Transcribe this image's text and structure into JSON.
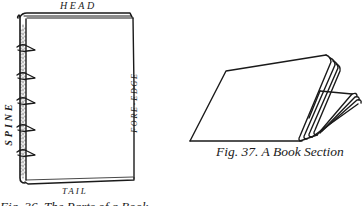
{
  "figure_left": {
    "title": "Parts of a book (bound volume)",
    "labels": {
      "head": "HEAD",
      "tail": "TAIL",
      "spine": "SPINE",
      "fore_edge": "FORE-EDGE"
    },
    "caption": "Fig. 36. The Parts of a Book",
    "band_count": 5
  },
  "figure_right": {
    "caption": "Fig. 37.  A Book Section"
  },
  "colors": {
    "ink": "#1a1a1a",
    "paper": "#ffffff"
  }
}
